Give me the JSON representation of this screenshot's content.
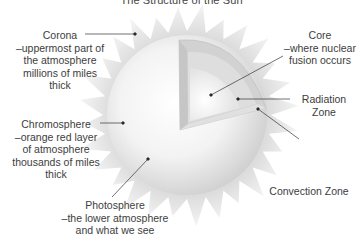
{
  "title": "The Structure of the Sun",
  "colors": {
    "background": "#ffffff",
    "corona": "#e6e6e6",
    "sphere_light": "#fbfbfb",
    "sphere_shade": "#d4d4d4",
    "radiation_zone": "#dcdcdc",
    "convection_zone": "#cfcfcf",
    "core": "#f7f7f7",
    "leader_line": "#333333",
    "text": "#3d3d3d"
  },
  "labels": {
    "corona": {
      "name": "Corona",
      "lines": [
        "–uppermost part of",
        "the atmosphere",
        "millions of miles",
        "thick"
      ]
    },
    "chromosphere": {
      "name": "Chromosphere",
      "lines": [
        "–orange red layer",
        "of atmosphere",
        "thousands of miles",
        "thick"
      ]
    },
    "photosphere": {
      "name": "Photosphere",
      "lines": [
        "–the lower atmosphere",
        "and what we see"
      ]
    },
    "core": {
      "name": "Core",
      "lines": [
        "–where nuclear",
        "fusion occurs"
      ]
    },
    "radiation_zone": {
      "name": "Radiation",
      "lines": [
        "Zone"
      ]
    },
    "convection_zone": {
      "name": "Convection Zone",
      "lines": []
    }
  },
  "icons": {
    "sun": "sun-cutaway-illustration"
  }
}
